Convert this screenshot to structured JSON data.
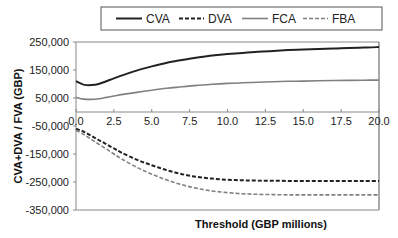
{
  "chart_data": {
    "type": "line",
    "title": "",
    "xlabel": "Threshold (GBP millions)",
    "ylabel": "CVA+DVA / FVA (GBP)",
    "xlim": [
      0,
      20
    ],
    "ylim": [
      -350000,
      250000
    ],
    "x_ticks": [
      "0.0",
      "2.5",
      "5.0",
      "7.5",
      "10.0",
      "12.5",
      "15.0",
      "17.5",
      "20.0"
    ],
    "y_ticks": [
      "250,000",
      "150,000",
      "50,000",
      "-50,000",
      "-150,000",
      "-250,000",
      "-350,000"
    ],
    "y_tick_values": [
      250000,
      150000,
      50000,
      -50000,
      -150000,
      -250000,
      -350000
    ],
    "grid": false,
    "legend_position": "top",
    "x": [
      0,
      0.5,
      1,
      1.5,
      2,
      2.5,
      3,
      4,
      5,
      6,
      7,
      8,
      9,
      10,
      11,
      12,
      13,
      14,
      15,
      16,
      17,
      18,
      19,
      20
    ],
    "series": [
      {
        "name": "CVA",
        "style": "solid",
        "color": "#222222",
        "values": [
          110000,
          98000,
          96000,
          100000,
          110000,
          120000,
          130000,
          148000,
          163000,
          176000,
          186000,
          195000,
          202000,
          207000,
          211000,
          215000,
          218000,
          221000,
          223000,
          225000,
          227000,
          229000,
          230000,
          232000
        ]
      },
      {
        "name": "DVA",
        "style": "dashed",
        "color": "#222222",
        "values": [
          -60000,
          -70000,
          -85000,
          -100000,
          -115000,
          -130000,
          -145000,
          -170000,
          -190000,
          -208000,
          -222000,
          -232000,
          -238000,
          -242000,
          -244000,
          -245000,
          -245500,
          -246000,
          -246000,
          -246000,
          -246000,
          -246000,
          -246000,
          -246000
        ]
      },
      {
        "name": "FCA",
        "style": "solid",
        "color": "#808080",
        "values": [
          52000,
          46000,
          45000,
          47000,
          52000,
          57000,
          62000,
          70000,
          78000,
          85000,
          90000,
          95000,
          99000,
          102000,
          104500,
          106500,
          108000,
          109500,
          110500,
          111500,
          112500,
          113000,
          113500,
          114000
        ]
      },
      {
        "name": "FBA",
        "style": "dashed",
        "color": "#808080",
        "values": [
          -65000,
          -80000,
          -97000,
          -115000,
          -132000,
          -150000,
          -167000,
          -197000,
          -222000,
          -243000,
          -260000,
          -273000,
          -282000,
          -288000,
          -292000,
          -294000,
          -295000,
          -296000,
          -296000,
          -296000,
          -296000,
          -296000,
          -296000,
          -296000
        ]
      }
    ]
  }
}
